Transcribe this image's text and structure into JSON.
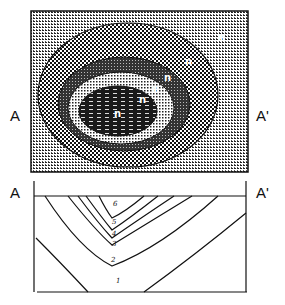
{
  "plan_view": {
    "section_start_label": "A",
    "section_end_label": "A'",
    "zone_labels": [
      "n",
      "n",
      "n",
      "n",
      "n",
      "n"
    ],
    "colors": {
      "ink": "#111111",
      "paper": "#ffffff"
    }
  },
  "cross_section": {
    "section_start_label": "A",
    "section_end_label": "A'",
    "contour_labels": [
      "6",
      "5",
      "4",
      "3",
      "2",
      "1"
    ]
  }
}
